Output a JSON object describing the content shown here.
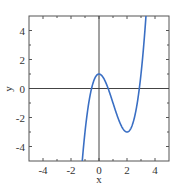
{
  "chart_data": {
    "type": "line",
    "title": "",
    "xlabel": "x",
    "ylabel": "y",
    "xlim": [
      -5,
      5
    ],
    "ylim": [
      -5,
      5
    ],
    "grid": false,
    "legend": null,
    "x_ticks": [
      -4,
      -2,
      0,
      2,
      4
    ],
    "y_ticks": [
      -4,
      -2,
      0,
      2,
      4
    ],
    "x_tick_labels": [
      "-4",
      "-2",
      "0",
      "2",
      "4"
    ],
    "y_tick_labels": [
      "-4",
      "-2",
      "0",
      "2",
      "4"
    ],
    "axes_through_origin": true,
    "series": [
      {
        "name": "f(x)",
        "formula": "x^3 - 3x^2 + 1",
        "color": "#3a6fc4",
        "x": [
          -1.2,
          -1.0,
          -0.5,
          0.0,
          0.5,
          1.0,
          1.5,
          2.0,
          2.5,
          3.0,
          3.35
        ],
        "values": [
          -5.05,
          -3.0,
          0.13,
          1.0,
          0.38,
          -1.0,
          -2.38,
          -3.0,
          -2.13,
          1.0,
          5.0
        ]
      }
    ],
    "annotations": {
      "local_max": [
        0,
        1
      ],
      "local_min": [
        2,
        -3
      ]
    }
  },
  "colors": {
    "frame": "#555555",
    "axes": "#444444",
    "curve": "#3a6fc4",
    "text": "#333333"
  }
}
